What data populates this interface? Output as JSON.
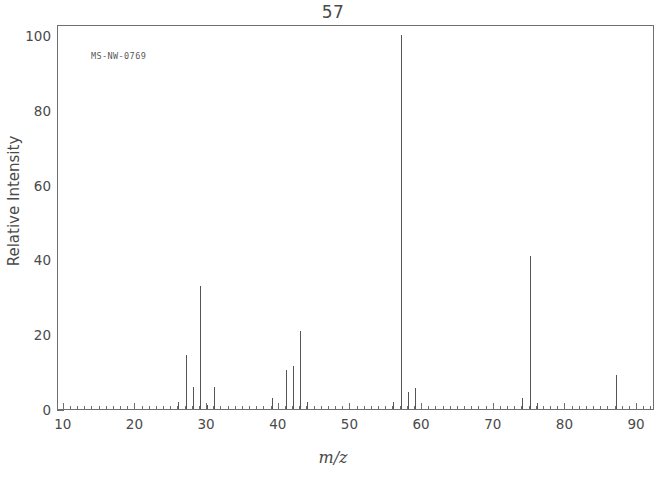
{
  "chart_data": {
    "type": "bar",
    "title": "57",
    "subtitle": "",
    "xlabel": "m/z",
    "ylabel": "Relative Intensity",
    "annotation": "MS-NW-0769",
    "xlim": [
      9.2,
      92.5
    ],
    "ylim": [
      0,
      103
    ],
    "grid": false,
    "legend": null,
    "x_ticks": [
      10,
      20,
      30,
      40,
      50,
      60,
      70,
      80,
      90
    ],
    "x_tick_labels": [
      "10",
      "20",
      "30",
      "40",
      "50",
      "60",
      "70",
      "80",
      "90"
    ],
    "x_minor_tick_step": 1,
    "y_ticks": [
      0,
      20,
      40,
      60,
      80,
      100
    ],
    "y_tick_labels": [
      "0",
      "20",
      "40",
      "60",
      "80",
      "100"
    ],
    "y_minor_ticks": [
      10,
      30,
      50,
      70,
      90
    ],
    "base_peak_mz": 57,
    "x": [
      26,
      27,
      28,
      29,
      30,
      31,
      39,
      41,
      42,
      43,
      44,
      56,
      57,
      58,
      59,
      74,
      75,
      76,
      87
    ],
    "values": [
      2,
      14.5,
      6,
      33,
      1,
      6,
      3,
      10.5,
      11.5,
      21,
      2,
      2,
      100,
      4.5,
      5.5,
      3,
      41,
      1.5,
      9
    ],
    "peaks": [
      {
        "mz": 26,
        "intensity": 2
      },
      {
        "mz": 27,
        "intensity": 14.5
      },
      {
        "mz": 28,
        "intensity": 6
      },
      {
        "mz": 29,
        "intensity": 33
      },
      {
        "mz": 30,
        "intensity": 1
      },
      {
        "mz": 31,
        "intensity": 6
      },
      {
        "mz": 39,
        "intensity": 3
      },
      {
        "mz": 41,
        "intensity": 10.5
      },
      {
        "mz": 42,
        "intensity": 11.5
      },
      {
        "mz": 43,
        "intensity": 21
      },
      {
        "mz": 44,
        "intensity": 2
      },
      {
        "mz": 56,
        "intensity": 2
      },
      {
        "mz": 57,
        "intensity": 100
      },
      {
        "mz": 58,
        "intensity": 4.5
      },
      {
        "mz": 59,
        "intensity": 5.5
      },
      {
        "mz": 74,
        "intensity": 3
      },
      {
        "mz": 75,
        "intensity": 41
      },
      {
        "mz": 76,
        "intensity": 1.5
      },
      {
        "mz": 87,
        "intensity": 9
      }
    ],
    "colors": {
      "peak": "#555555",
      "axis": "#6f6f6f",
      "text": "#4a4a4a",
      "background": "#ffffff"
    }
  }
}
